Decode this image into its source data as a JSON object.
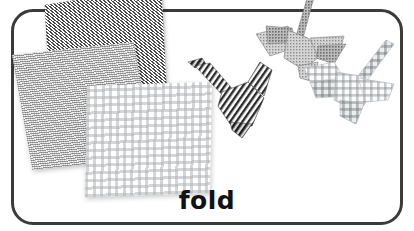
{
  "card": {
    "caption": "fold",
    "border_color": "#3b3b3d",
    "background_color": "#ffffff",
    "caption_color": "#121212"
  },
  "illustration": {
    "description": "Three patterned origami paper squares stacked at left and three folded paper cranes at right",
    "papers": [
      {
        "name": "zigzag-paper-square",
        "pattern": "dark-zigzag-herringbone",
        "color": "#4a4a4a"
      },
      {
        "name": "gray-paper-square",
        "pattern": "medium-gray-woven-texture",
        "color": "#c9c9c9"
      },
      {
        "name": "gingham-paper-square",
        "pattern": "light-gray-gingham-check",
        "color": "#b0b4b6"
      }
    ],
    "cranes": [
      {
        "name": "striped-origami-crane",
        "pattern": "dark-diagonal-stripe",
        "color": "#2e2e2e"
      },
      {
        "name": "gray-origami-crane",
        "pattern": "medium-gray-texture",
        "color": "#9a9a9a"
      },
      {
        "name": "gingham-origami-crane",
        "pattern": "light-gray-check",
        "color": "#c4c8ca"
      }
    ]
  }
}
